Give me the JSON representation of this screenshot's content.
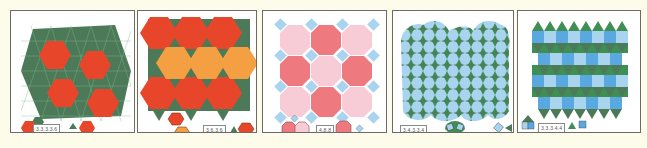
{
  "figure": {
    "background": "#fdfbe9",
    "panels": [
      {
        "id": "p1",
        "notation": "3.3.3.3.6",
        "description": "Snub hexagonal tiling",
        "colors": {
          "hexagon": "#e8462a",
          "triangle_dark": "#4c7a58",
          "triangle_light": "#3f8f55"
        }
      },
      {
        "id": "p2",
        "notation": "3.6.3.6",
        "description": "Trihexagonal tiling",
        "colors": {
          "hexagon_red": "#e8462a",
          "hexagon_orange": "#f4a042",
          "triangle": "#4c7a58"
        }
      },
      {
        "id": "p3",
        "notation": "4.8.8",
        "description": "Truncated square tiling",
        "colors": {
          "octagon_dark": "#ee7a80",
          "octagon_light": "#f8ccd6",
          "square": "#a9d4ef"
        }
      },
      {
        "id": "p4",
        "notation": "3.4.3.3.4",
        "description": "Snub square tiling",
        "colors": {
          "square": "#a9d4ef",
          "triangle": "#3f8f55"
        }
      },
      {
        "id": "p5",
        "notation": "3.3.3.4.4",
        "description": "Elongated triangular tiling",
        "colors": {
          "square_dark": "#5aa8e0",
          "square_light": "#a9d4ef",
          "triangle": "#3f8f55"
        }
      }
    ]
  }
}
